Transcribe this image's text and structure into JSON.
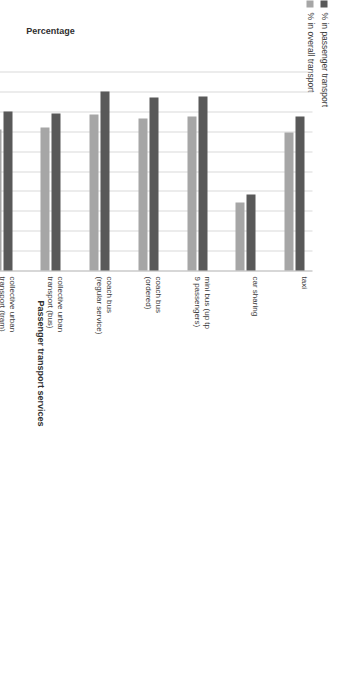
{
  "chart_data": {
    "type": "bar",
    "orientation": "vertical-grouped-rotated",
    "title": "",
    "xlabel": "Passenger transport services",
    "ylabel": "Percentage",
    "ylim": [
      0,
      100
    ],
    "ytick_labels": [
      "100,00%",
      "90,00%",
      "80,00%",
      "70,00%",
      "60,00%",
      "50,00%",
      "40,00%",
      "30,00%",
      "20,00%",
      "10,00%",
      "0,00%"
    ],
    "ytick_values": [
      100,
      90,
      80,
      70,
      60,
      50,
      40,
      30,
      20,
      10,
      0
    ],
    "grid": true,
    "legend_position": "top-left",
    "categories": [
      "taxi",
      "car sharing",
      "mini bus (up tp 9 passengers)",
      "coach bus (ordered)",
      "coach bus (regular service)",
      "collective urban transport (bus)",
      "collective urban transport (tram)",
      "Railway transport (regional)",
      "Railway transport (intercity)",
      "medical transport (ambulance)",
      "air transport"
    ],
    "series": [
      {
        "name": "% in passenger transport",
        "color": "#595959",
        "values": [
          77.5,
          38.0,
          87.5,
          87.0,
          90.0,
          79.0,
          80.0,
          80.5,
          80.0,
          77.0,
          81.0
        ]
      },
      {
        "name": "% in overall transport",
        "color": "#a6a6a6",
        "values": [
          69.5,
          34.0,
          77.5,
          76.5,
          78.5,
          72.0,
          71.0,
          79.0,
          78.0,
          70.0,
          70.0
        ]
      }
    ]
  },
  "legend": {
    "items": [
      {
        "label": "% in passenger transport",
        "color": "#595959"
      },
      {
        "label": "% in overall transport",
        "color": "#a6a6a6"
      }
    ]
  },
  "axes": {
    "value_axis_title": "Percentage",
    "category_axis_title": "Passenger transport services"
  }
}
